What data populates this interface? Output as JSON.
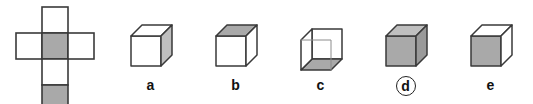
{
  "figure": {
    "background_color": "#ffffff"
  },
  "colors": {
    "stroke": "#3a3a3a",
    "stroke_light": "#8c8c8c",
    "face_white": "#ffffff",
    "face_gray": "#a9a9a9",
    "face_gray_light": "#bfbfbf",
    "face_gray_dark": "#9a9a9a",
    "label_color": "#111111",
    "ring_color": "#222222"
  },
  "net": {
    "name": "cube-net-latin-cross",
    "description": "Latin cross net of a cube with six squares; two squares are shaded gray",
    "cell_size_px": 26,
    "cells": [
      {
        "id": "top",
        "col": 1,
        "row": 0,
        "fill": "white"
      },
      {
        "id": "left",
        "col": 0,
        "row": 1,
        "fill": "white"
      },
      {
        "id": "center",
        "col": 1,
        "row": 1,
        "fill": "gray"
      },
      {
        "id": "right",
        "col": 2,
        "row": 1,
        "fill": "white"
      },
      {
        "id": "below-center",
        "col": 1,
        "row": 2,
        "fill": "white"
      },
      {
        "id": "bottom",
        "col": 1,
        "row": 3,
        "fill": "gray"
      }
    ],
    "shaded_count": 2,
    "white_count": 4
  },
  "options": [
    {
      "key": "a",
      "label": "a",
      "circled": false,
      "cube": {
        "name": "cube-a",
        "front": "white",
        "top": "white",
        "side": "gray-light",
        "orientation": "standard"
      }
    },
    {
      "key": "b",
      "label": "b",
      "circled": false,
      "cube": {
        "name": "cube-b",
        "front": "white",
        "top": "gray",
        "side": "white",
        "orientation": "standard"
      }
    },
    {
      "key": "c",
      "label": "c",
      "circled": false,
      "cube": {
        "name": "cube-c",
        "front": "white",
        "top": "white",
        "side": "white",
        "bottom": "gray",
        "orientation": "from-below"
      }
    },
    {
      "key": "d",
      "label": "d",
      "circled": true,
      "cube": {
        "name": "cube-d",
        "front": "gray",
        "top": "gray-light",
        "side": "gray-dark",
        "orientation": "standard"
      }
    },
    {
      "key": "e",
      "label": "e",
      "circled": false,
      "cube": {
        "name": "cube-e",
        "front": "gray",
        "top": "white",
        "side": "white",
        "orientation": "standard"
      }
    }
  ],
  "answer": {
    "selected_key": "d",
    "marker": "circle"
  }
}
